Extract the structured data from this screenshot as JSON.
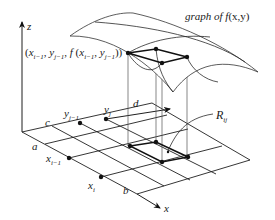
{
  "diagram": {
    "title_label": "graph of f(x,y)",
    "title_parts": {
      "pre": "graph of ",
      "f": "f",
      "args": "(x,y)"
    },
    "point_label": "(x_{i-1}, y_{j-1}, f(x_{i-1}, y_{j-1}))",
    "axes": {
      "z": "z",
      "x": "x"
    },
    "bounds": {
      "a": "a",
      "b": "b",
      "c": "c",
      "d": "d"
    },
    "ticks": {
      "x_prev": {
        "base": "x",
        "sub": "i−1"
      },
      "x_cur": {
        "base": "x",
        "sub": "i"
      },
      "y_prev": {
        "base": "y",
        "sub": "j−1"
      },
      "y_cur": {
        "base": "y",
        "sub": "j"
      }
    },
    "region_label": {
      "base": "R",
      "sub": "ij"
    },
    "colors": {
      "stroke": "#1f1f1f",
      "background": "#ffffff"
    }
  }
}
